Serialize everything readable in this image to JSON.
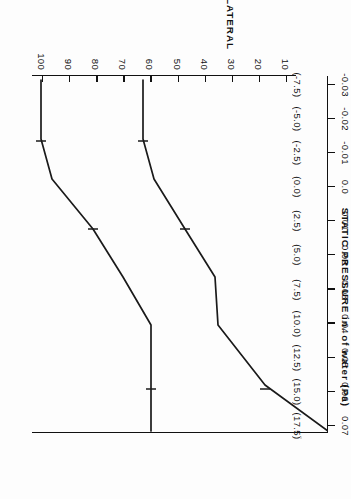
{
  "figure": {
    "pressure_axis_title": "STATIC PRESSURE   in. of water   (Pa)",
    "distance_axis_title": "% DISTANCE ALONG LATERAL"
  },
  "chart_data": {
    "type": "line",
    "title": "",
    "xlabel": "% DISTANCE ALONG LATERAL",
    "ylabel": "STATIC PRESSURE   in. of water   (Pa)",
    "xlim": [
      10,
      100
    ],
    "ylim": [
      -0.03,
      0.07
    ],
    "grid": false,
    "legend": "none",
    "orientation": "rotated-90-ccw",
    "xticks": [
      10,
      20,
      30,
      40,
      50,
      60,
      70,
      80,
      90,
      100
    ],
    "xticklabels": [
      "10",
      "20",
      "30",
      "40",
      "50",
      "60",
      "70",
      "80",
      "90",
      "100"
    ],
    "yticks": [
      0.07,
      0.06,
      0.05,
      0.04,
      0.03,
      0.02,
      0.01,
      0.0,
      -0.01,
      -0.02,
      -0.03
    ],
    "yticklabels": [
      "0.07",
      "0.06",
      "0.05",
      "0.04",
      "0.03",
      "0.02",
      "0.01",
      "0.0",
      "-0.01",
      "-0.02",
      "-0.03"
    ],
    "ytick_secondary_labels": [
      "(17.5)",
      "(15.0)",
      "(12.5)",
      "(10.0)",
      "(7.5)",
      "(5.0)",
      "(2.5)",
      "(0.0)",
      "(-2.5)",
      "(-5.0)",
      "(-7.5)"
    ],
    "series": [
      {
        "name": "upper-curve",
        "x": [
          13,
          25,
          37,
          50,
          62,
          75,
          85,
          100
        ],
        "values": [
          0.02,
          0.02,
          0.02,
          0.027,
          0.035,
          0.046,
          0.05,
          0.05
        ]
      },
      {
        "name": "lower-curve",
        "x": [
          13,
          25,
          37,
          50,
          62,
          75,
          85,
          100
        ],
        "values": [
          -0.03,
          -0.009,
          0.008,
          0.009,
          0.019,
          0.029,
          0.03,
          0.03
        ]
      }
    ]
  },
  "pressure_ticks": [
    {
      "primary": "0.07",
      "paren": "(17.5)"
    },
    {
      "primary": "0.06",
      "paren": "(15.0)"
    },
    {
      "primary": "0.05",
      "paren": "(12.5)"
    },
    {
      "primary": "0.04",
      "paren": "(10.0)"
    },
    {
      "primary": "0.03",
      "paren": "(7.5)"
    },
    {
      "primary": "0.02",
      "paren": "(5.0)"
    },
    {
      "primary": "0.01",
      "paren": "(2.5)"
    },
    {
      "primary": "0.0",
      "paren": "(0.0)"
    },
    {
      "primary": "-0.01",
      "paren": "(-2.5)"
    },
    {
      "primary": "-0.02",
      "paren": "(-5.0)"
    },
    {
      "primary": "-0.03",
      "paren": "(-7.5)"
    }
  ],
  "distance_ticks": [
    {
      "label": "100"
    },
    {
      "label": "90"
    },
    {
      "label": "80"
    },
    {
      "label": "70"
    },
    {
      "label": "60"
    },
    {
      "label": "50"
    },
    {
      "label": "40"
    },
    {
      "label": "30"
    },
    {
      "label": "20"
    },
    {
      "label": "10"
    }
  ]
}
